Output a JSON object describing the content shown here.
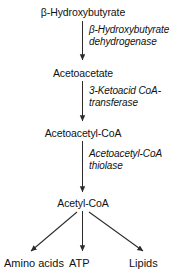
{
  "diagram": {
    "background_color": "#ffffff",
    "line_color": "#2b2b2b",
    "text_color": "#111111",
    "metabolites": [
      {
        "id": "beta-hydroxybutyrate",
        "label": "β-Hydroxybutyrate"
      },
      {
        "id": "acetoacetate",
        "label": "Acetoacetate"
      },
      {
        "id": "acetoacetyl-coa",
        "label": "Acetoacetyl-CoA"
      },
      {
        "id": "acetyl-coa",
        "label": "Acetyl-CoA"
      }
    ],
    "enzymes": [
      {
        "id": "beta-hydroxybutyrate-dehydrogenase",
        "line1": "β-Hydroxybutyrate",
        "line2": "dehydrogenase"
      },
      {
        "id": "3-ketoacid-coa-transferase",
        "line1": "3-Ketoacid CoA-",
        "line2": "transferase"
      },
      {
        "id": "acetoacetyl-coa-thiolase",
        "line1": "Acetoacetyl-CoA",
        "line2": "thiolase"
      }
    ],
    "products": [
      {
        "id": "amino-acids",
        "label": "Amino acids"
      },
      {
        "id": "atp",
        "label": "ATP"
      },
      {
        "id": "lipids",
        "label": "Lipids"
      }
    ]
  }
}
